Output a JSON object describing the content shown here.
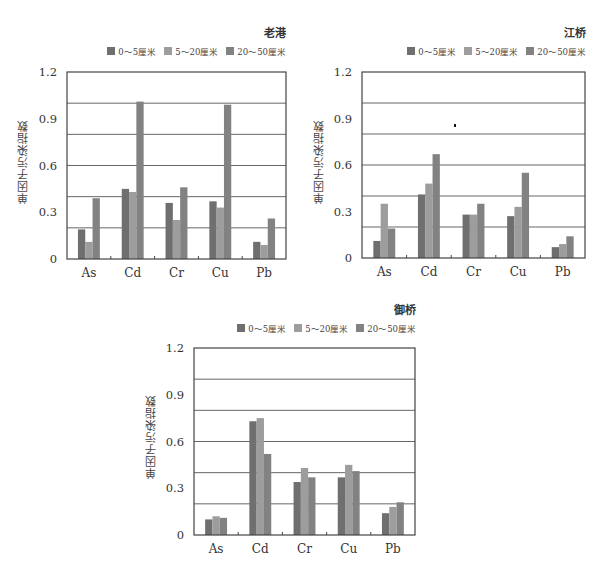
{
  "colors": {
    "series_0_5": "#6f6f6f",
    "series_5_20": "#9d9d9d",
    "series_20_50": "#828282",
    "gridline": "#555555",
    "axis": "#444444"
  },
  "legend": [
    "0～5厘米",
    "5～20厘米",
    "20～50厘米"
  ],
  "y_axis_label": "单因子污染指数",
  "chart_data": [
    {
      "type": "bar",
      "title": "老港",
      "xlabel": "",
      "ylabel": "单因子污染指数",
      "ylim": [
        0,
        1.2
      ],
      "yticks": [
        0,
        0.3,
        0.6,
        0.9,
        1.2
      ],
      "gridlines": [
        0.2,
        0.4,
        0.6,
        0.8,
        1.0
      ],
      "legend_position": "top-right",
      "categories": [
        "As",
        "Cd",
        "Cr",
        "Cu",
        "Pb"
      ],
      "series": [
        {
          "name": "0～5厘米",
          "values": [
            0.19,
            0.45,
            0.36,
            0.37,
            0.11
          ]
        },
        {
          "name": "5～20厘米",
          "values": [
            0.11,
            0.43,
            0.25,
            0.33,
            0.09
          ]
        },
        {
          "name": "20～50厘米",
          "values": [
            0.39,
            1.01,
            0.46,
            0.99,
            0.26
          ]
        }
      ]
    },
    {
      "type": "bar",
      "title": "江桥",
      "xlabel": "",
      "ylabel": "单因子污染指数",
      "ylim": [
        0,
        1.2
      ],
      "yticks": [
        0,
        0.3,
        0.6,
        0.9,
        1.2
      ],
      "gridlines": [
        0.2,
        0.4,
        0.6,
        0.8,
        1.0
      ],
      "legend_position": "top-right",
      "categories": [
        "As",
        "Cd",
        "Cr",
        "Cu",
        "Pb"
      ],
      "series": [
        {
          "name": "0～5厘米",
          "values": [
            0.11,
            0.41,
            0.28,
            0.27,
            0.07
          ]
        },
        {
          "name": "5～20厘米",
          "values": [
            0.35,
            0.48,
            0.28,
            0.33,
            0.09
          ]
        },
        {
          "name": "20～50厘米",
          "values": [
            0.19,
            0.67,
            0.35,
            0.55,
            0.14
          ]
        }
      ]
    },
    {
      "type": "bar",
      "title": "御桥",
      "xlabel": "",
      "ylabel": "单因子污染指数",
      "ylim": [
        0,
        1.2
      ],
      "yticks": [
        0,
        0.3,
        0.6,
        0.9,
        1.2
      ],
      "gridlines": [
        0.2,
        0.4,
        0.6,
        0.8,
        1.0
      ],
      "legend_position": "top-right",
      "categories": [
        "As",
        "Cd",
        "Cr",
        "Cu",
        "Pb"
      ],
      "series": [
        {
          "name": "0～5厘米",
          "values": [
            0.1,
            0.73,
            0.34,
            0.37,
            0.14
          ]
        },
        {
          "name": "5～20厘米",
          "values": [
            0.12,
            0.75,
            0.43,
            0.45,
            0.18
          ]
        },
        {
          "name": "20～50厘米",
          "values": [
            0.11,
            0.52,
            0.37,
            0.41,
            0.21
          ]
        }
      ]
    }
  ]
}
